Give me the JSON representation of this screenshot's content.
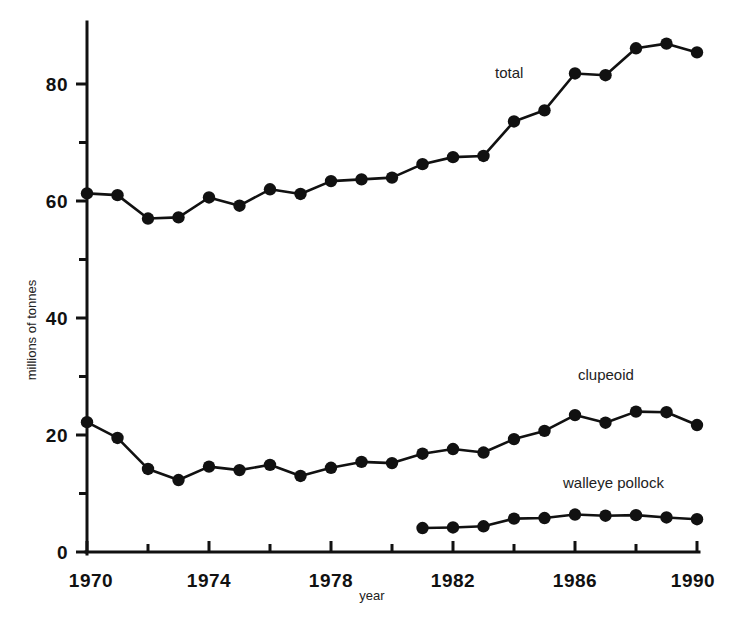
{
  "chart_data": {
    "type": "line",
    "title": "",
    "subtitle": "",
    "xlabel": "year",
    "ylabel": "millions of tonnes",
    "xlim": [
      1970,
      1990
    ],
    "ylim": [
      0,
      90
    ],
    "grid": false,
    "legend_position": "inline-annotations",
    "x_ticks": [
      1970,
      1974,
      1978,
      1982,
      1986,
      1990
    ],
    "x_ticks_minor": [
      1972,
      1976,
      1980,
      1984,
      1988
    ],
    "y_ticks": [
      0,
      20,
      40,
      60,
      80
    ],
    "y_ticks_minor": [
      10,
      30,
      50,
      70
    ],
    "x": [
      1970,
      1971,
      1972,
      1973,
      1974,
      1975,
      1976,
      1977,
      1978,
      1979,
      1980,
      1981,
      1982,
      1983,
      1984,
      1985,
      1986,
      1987,
      1988,
      1989,
      1990
    ],
    "series": [
      {
        "name": "total",
        "label": "total",
        "x": [
          1970,
          1971,
          1972,
          1973,
          1974,
          1975,
          1976,
          1977,
          1978,
          1979,
          1980,
          1981,
          1982,
          1983,
          1984,
          1985,
          1986,
          1987,
          1988,
          1989,
          1990
        ],
        "values": [
          61.3,
          61.0,
          57.0,
          57.2,
          60.6,
          59.2,
          62.0,
          61.2,
          63.4,
          63.7,
          64.0,
          66.3,
          67.5,
          67.7,
          73.6,
          75.5,
          81.8,
          81.5,
          86.1,
          86.9,
          85.4
        ]
      },
      {
        "name": "clupeoid",
        "label": "clupeoid",
        "x": [
          1970,
          1971,
          1972,
          1973,
          1974,
          1975,
          1976,
          1977,
          1978,
          1979,
          1980,
          1981,
          1982,
          1983,
          1984,
          1985,
          1986,
          1987,
          1988,
          1989,
          1990
        ],
        "values": [
          22.2,
          19.5,
          14.2,
          12.3,
          14.6,
          14.0,
          14.9,
          13.0,
          14.4,
          15.4,
          15.2,
          16.8,
          17.6,
          17.0,
          19.3,
          20.7,
          23.4,
          22.1,
          24.0,
          23.9,
          21.7
        ]
      },
      {
        "name": "walleye pollock",
        "label": "walleye pollock",
        "x": [
          1981,
          1982,
          1983,
          1984,
          1985,
          1986,
          1987,
          1988,
          1989,
          1990
        ],
        "values": [
          4.1,
          4.2,
          4.4,
          5.7,
          5.8,
          6.4,
          6.2,
          6.3,
          5.9,
          5.6
        ]
      }
    ],
    "annotations": [
      {
        "text": "total",
        "x": 1984.0,
        "y": 80.0
      },
      {
        "text": "clupeoid",
        "x": 1987.0,
        "y": 30.5
      },
      {
        "text": "walleye pollock",
        "x": 1987.2,
        "y": 13.2
      }
    ],
    "colors": {
      "line": "#111111",
      "marker": "#111111",
      "axis": "#111111",
      "background": "#ffffff"
    }
  },
  "labels": {
    "y_0": "0",
    "y_20": "20",
    "y_40": "40",
    "y_60": "60",
    "y_80": "80",
    "x_1970": "1970",
    "x_1974": "1974",
    "x_1978": "1978",
    "x_1982": "1982",
    "x_1986": "1986",
    "x_1990": "1990",
    "xaxis_title": "year",
    "yaxis_title": "millions of tonnes",
    "ann_total": "total",
    "ann_clupeoid": "clupeoid",
    "ann_walleye": "walleye pollock"
  }
}
